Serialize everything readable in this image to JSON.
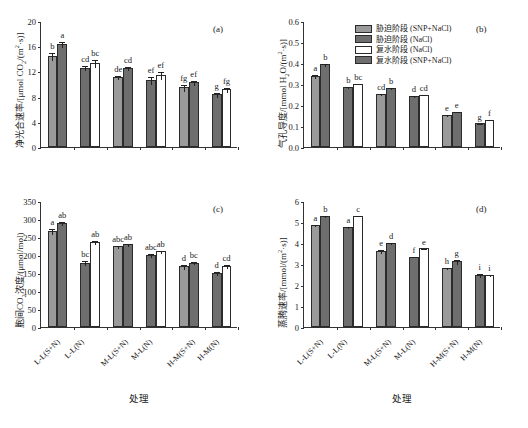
{
  "figure": {
    "xlabel": "处理",
    "categories": [
      "L-L(S+N)",
      "L-L(N)",
      "M-L(S+N)",
      "M-L(N)",
      "H-M(S+N)",
      "H-M(N)"
    ],
    "colors": {
      "light_gray": "#9a9a9a",
      "dark_gray": "#6e6e6e",
      "white": "#ffffff",
      "outline": "#2b2b2b"
    }
  },
  "legend": {
    "items": [
      {
        "label": "胁迫阶段 (SNP+NaCl)",
        "color": "#9a9a9a"
      },
      {
        "label": "胁迫阶段 (NaCl)",
        "color": "#6e6e6e"
      },
      {
        "label": "复水阶段 (NaCl)",
        "color": "#ffffff"
      },
      {
        "label": "复水阶段 (SNP+NaCl)",
        "color": "#6e6e6e"
      }
    ]
  },
  "chart_data": [
    {
      "type": "bar",
      "panel": "(a)",
      "title": "",
      "ylabel": "净光合速率/[μmol CO₂/(m²·s)]",
      "xlabel": "处理",
      "ylim": [
        0,
        20
      ],
      "yticks": [
        0,
        4,
        8,
        12,
        16,
        20
      ],
      "categories": [
        "L-L(S+N)",
        "L-L(N)",
        "M-L(S+N)",
        "M-L(N)",
        "H-M(S+N)",
        "H-M(N)"
      ],
      "series": [
        {
          "name": "bar1",
          "values": [
            14.5,
            12.6,
            11.1,
            10.6,
            9.45,
            8.35
          ],
          "errors": [
            0.65,
            0.35,
            0.35,
            0.65,
            0.55,
            0.35
          ],
          "fills": [
            "light_gray",
            "dark_gray",
            "light_gray",
            "dark_gray",
            "light_gray",
            "dark_gray"
          ],
          "letters": [
            "b",
            "cd",
            "de",
            "ef",
            "fg",
            "g"
          ]
        },
        {
          "name": "bar2",
          "values": [
            16.35,
            13.35,
            12.5,
            11.45,
            10.25,
            9.2
          ],
          "errors": [
            0.55,
            0.65,
            0.35,
            0.6,
            0.4,
            0.4
          ],
          "fills": [
            "dark_gray",
            "white",
            "dark_gray",
            "white",
            "dark_gray",
            "white"
          ],
          "letters": [
            "a",
            "bc",
            "cd",
            "ef",
            "ef",
            "fg"
          ]
        }
      ]
    },
    {
      "type": "bar",
      "panel": "(b)",
      "title": "",
      "ylabel": "气孔导度/[mmol H₂O/(m²·s)]",
      "xlabel": "处理",
      "ylim": [
        0,
        0.6
      ],
      "yticks": [
        0.0,
        0.1,
        0.2,
        0.3,
        0.4,
        0.5,
        0.6
      ],
      "categories": [
        "L-L(S+N)",
        "L-L(N)",
        "M-L(S+N)",
        "M-L(N)",
        "H-M(S+N)",
        "H-M(N)"
      ],
      "series": [
        {
          "name": "bar1",
          "values": [
            0.339,
            0.285,
            0.253,
            0.242,
            0.152,
            0.112
          ],
          "errors": [
            0.011,
            0.004,
            0.005,
            0.004,
            0.005,
            0.004
          ],
          "fills": [
            "light_gray",
            "dark_gray",
            "light_gray",
            "dark_gray",
            "light_gray",
            "dark_gray"
          ],
          "letters": [
            "a",
            "b",
            "cd",
            "d",
            "e",
            "g"
          ]
        },
        {
          "name": "bar2",
          "values": [
            0.394,
            0.302,
            0.281,
            0.25,
            0.169,
            0.131
          ],
          "errors": [
            0.006,
            0.003,
            0.004,
            0.004,
            0.004,
            0.003
          ],
          "fills": [
            "dark_gray",
            "white",
            "dark_gray",
            "white",
            "dark_gray",
            "white"
          ],
          "letters": [
            "b",
            "bc",
            "b",
            "cd",
            "e",
            "f"
          ]
        }
      ]
    },
    {
      "type": "bar",
      "panel": "(c)",
      "title": "",
      "ylabel": "胞间CO₂浓度/(μmol/mol)",
      "xlabel": "处理",
      "ylim": [
        0,
        350
      ],
      "yticks": [
        0,
        50,
        100,
        150,
        200,
        250,
        300,
        350
      ],
      "categories": [
        "L-L(S+N)",
        "L-L(N)",
        "M-L(S+N)",
        "M-L(N)",
        "H-M(S+N)",
        "H-M(N)"
      ],
      "series": [
        {
          "name": "bar1",
          "values": [
            266,
            178,
            224,
            200,
            169,
            150
          ],
          "errors": [
            8,
            7,
            4,
            5,
            7,
            6
          ],
          "fills": [
            "light_gray",
            "dark_gray",
            "light_gray",
            "dark_gray",
            "light_gray",
            "dark_gray"
          ],
          "letters": [
            "a",
            "bc",
            "abc",
            "abc",
            "d",
            "d"
          ]
        },
        {
          "name": "bar2",
          "values": [
            289,
            236,
            230,
            210,
            179,
            169
          ],
          "errors": [
            5,
            5,
            4,
            4,
            5,
            6
          ],
          "fills": [
            "dark_gray",
            "white",
            "dark_gray",
            "white",
            "dark_gray",
            "white"
          ],
          "letters": [
            "ab",
            "ab",
            "ab",
            "ab",
            "bc",
            "cd"
          ]
        }
      ]
    },
    {
      "type": "bar",
      "panel": "(d)",
      "title": "",
      "ylabel": "蒸腾速率/[mmol/(m²·s)]",
      "xlabel": "处理",
      "ylim": [
        0,
        6
      ],
      "yticks": [
        0,
        1,
        2,
        3,
        4,
        5,
        6
      ],
      "categories": [
        "L-L(S+N)",
        "L-L(N)",
        "M-L(S+N)",
        "M-L(N)",
        "H-M(S+N)",
        "H-M(N)"
      ],
      "series": [
        {
          "name": "bar1",
          "values": [
            4.86,
            4.76,
            3.62,
            3.35,
            2.79,
            2.48
          ],
          "errors": [
            0.05,
            0.05,
            0.08,
            0.04,
            0.05,
            0.08
          ],
          "fills": [
            "light_gray",
            "dark_gray",
            "light_gray",
            "dark_gray",
            "light_gray",
            "dark_gray"
          ],
          "letters": [
            "a",
            "a",
            "e",
            "f",
            "h",
            "i"
          ]
        },
        {
          "name": "bar2",
          "values": [
            5.29,
            5.3,
            4.01,
            3.74,
            3.13,
            2.48
          ],
          "errors": [
            0.05,
            0.03,
            0.06,
            0.04,
            0.12,
            0.04
          ],
          "fills": [
            "dark_gray",
            "white",
            "dark_gray",
            "white",
            "dark_gray",
            "white"
          ],
          "letters": [
            "b",
            "c",
            "d",
            "e",
            "g",
            "i"
          ]
        }
      ]
    }
  ]
}
